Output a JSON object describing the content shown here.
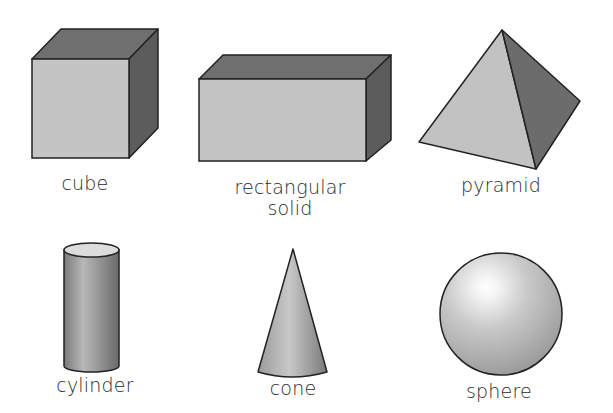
{
  "shapes": {
    "cube": {
      "label": "cube"
    },
    "rectangular_solid": {
      "label_line1": "rectangular",
      "label_line2": "solid"
    },
    "pyramid": {
      "label": "pyramid"
    },
    "cylinder": {
      "label": "cylinder"
    },
    "cone": {
      "label": "cone"
    },
    "sphere": {
      "label": "sphere"
    }
  },
  "colors": {
    "front_face": "#c4c4c4",
    "dark_face": "#6e6e6e",
    "side_face": "#5e5e5e",
    "outline": "#222222"
  }
}
